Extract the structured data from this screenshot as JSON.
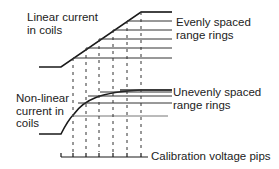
{
  "labels": {
    "linear": [
      "Linear current",
      "in coils"
    ],
    "even": [
      "Evenly spaced",
      "range rings"
    ],
    "nonlinear": [
      "Non-linear",
      "current in",
      "coils"
    ],
    "uneven": [
      "Unevenly spaced",
      "range rings"
    ],
    "pips": "Calibration voltage pips"
  },
  "geometry": {
    "pip_x": [
      61,
      73,
      86,
      99,
      113,
      127,
      141
    ],
    "top_rings_y": [
      12,
      21,
      30,
      39,
      48,
      58
    ],
    "bottom_rings_y": [
      90,
      92,
      96,
      103,
      116
    ],
    "colors": {
      "line": "#1a1a1a",
      "background": "#ffffff"
    }
  }
}
